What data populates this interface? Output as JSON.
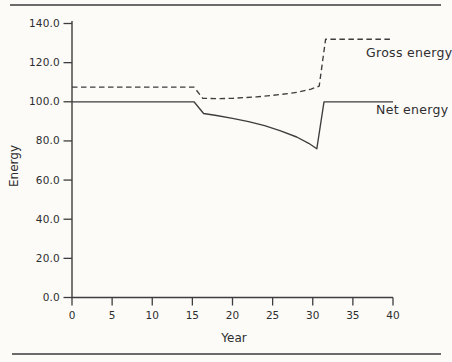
{
  "chart_data": {
    "type": "line",
    "title": "",
    "xlabel": "Year",
    "ylabel": "Energy",
    "xlim": [
      0,
      40
    ],
    "ylim": [
      0,
      140
    ],
    "x_ticks": [
      0,
      5,
      10,
      15,
      20,
      25,
      30,
      35,
      40
    ],
    "x_tick_labels": [
      "0",
      "5",
      "10",
      "15",
      "20",
      "25",
      "30",
      "35",
      "40"
    ],
    "y_ticks": [
      140,
      120,
      100,
      80,
      60,
      40,
      20,
      0
    ],
    "y_tick_labels": [
      "140.0",
      "120.0",
      "100.0",
      "80.0",
      "60.0",
      "40.0",
      "20.0",
      "0.0"
    ],
    "grid": false,
    "legend_position": "labels-right-of-lines",
    "line_color": "#3d3d3d",
    "background_color": "#fcfbf8",
    "series": [
      {
        "name": "Gross energy",
        "style": "dashed",
        "points": [
          [
            0,
            107.5
          ],
          [
            15.2,
            107.5
          ],
          [
            16.3,
            101.8
          ],
          [
            18,
            101.6
          ],
          [
            20,
            101.8
          ],
          [
            23,
            102.5
          ],
          [
            26,
            103.7
          ],
          [
            28,
            104.8
          ],
          [
            29.8,
            106.5
          ],
          [
            30.8,
            108
          ],
          [
            31.6,
            132
          ],
          [
            40,
            132
          ]
        ]
      },
      {
        "name": "Net energy",
        "style": "solid",
        "points": [
          [
            0,
            100
          ],
          [
            15.2,
            100
          ],
          [
            16.4,
            94
          ],
          [
            18,
            93
          ],
          [
            20,
            91.5
          ],
          [
            22,
            89.8
          ],
          [
            24,
            87.8
          ],
          [
            26,
            85.2
          ],
          [
            28,
            82
          ],
          [
            29.5,
            78.8
          ],
          [
            30.5,
            76
          ],
          [
            31.4,
            100
          ],
          [
            40,
            100
          ]
        ]
      }
    ]
  }
}
